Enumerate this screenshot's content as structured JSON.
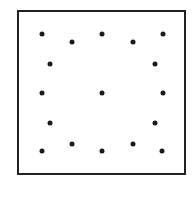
{
  "diagram": {
    "type": "dot-pattern-in-square",
    "frame": {
      "x": 17,
      "y": 10,
      "width": 169,
      "height": 165,
      "stroke": "#222222"
    },
    "dot_color": "#1a1a1a",
    "dots": [
      {
        "x": 42,
        "y": 34
      },
      {
        "x": 72,
        "y": 42
      },
      {
        "x": 102,
        "y": 34
      },
      {
        "x": 133,
        "y": 42
      },
      {
        "x": 163,
        "y": 34
      },
      {
        "x": 50,
        "y": 64
      },
      {
        "x": 155,
        "y": 64
      },
      {
        "x": 42,
        "y": 93
      },
      {
        "x": 102,
        "y": 93
      },
      {
        "x": 163,
        "y": 93
      },
      {
        "x": 50,
        "y": 123
      },
      {
        "x": 155,
        "y": 123
      },
      {
        "x": 42,
        "y": 151
      },
      {
        "x": 72,
        "y": 144
      },
      {
        "x": 102,
        "y": 151
      },
      {
        "x": 133,
        "y": 144
      },
      {
        "x": 162,
        "y": 151
      }
    ]
  }
}
